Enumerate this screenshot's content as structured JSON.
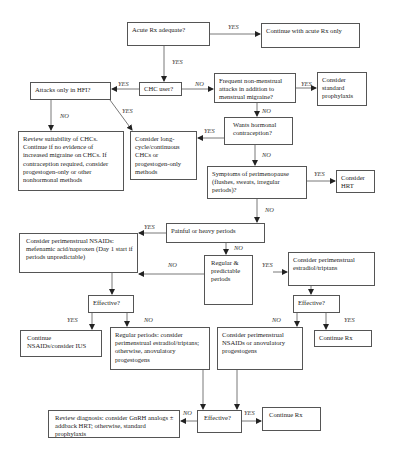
{
  "flowchart": {
    "nodes": {
      "acute_rx": "Acute Rx adequate?",
      "continue_acute": "Continue with acute Rx only",
      "chc_user": "CHC user?",
      "attacks_hfi": "Attacks only in HFI?",
      "frequent_nonmenstrual": "Frequent non-menstrual attacks in addition to menstrual migraine?",
      "standard_prophylaxis": "Consider standard prophylaxis",
      "review_chc": "Review suitability of CHCs. Continue if no evidence of increased migraine on CHCs. If contraception required, consider progestogen-only or other nonhormonal methods",
      "long_cycle": "Consider long-cycle/continuous CHCs or progestogen-only methods",
      "wants_hormonal": "Wants hormonal contraception?",
      "perimenopause": "Symptoms of perimenopause (flushes, sweats, irregular periods)?",
      "consider_hrt": "Consider HRT",
      "painful_heavy": "Painful or heavy periods",
      "nsaids": "Consider perimenstrual NSAIDs: mefenamic acid/naproxen (Day 1 start if periods unpredictable)",
      "regular_predictable": "Regular & predictable periods",
      "estradiol_triptans": "Consider perimenstrual estradiol/triptans",
      "effective_left": "Effective?",
      "effective_right": "Effective?",
      "continue_nsaids": "Continue NSAIDs/consider IUS",
      "regular_consider": "Regular periods: consider perimenstrual estradiol/triptans; otherwise, anovulatory progestogens",
      "nsaids_anovulatory": "Consider perimenstrual NSAIDs or anovulatory progestogens",
      "continue_rx_right": "Continue Rx",
      "effective_bottom": "Effective?",
      "review_diagnosis": "Review diagnosis: consider GnRH analogs ± addback HRT; otherwise, standard prophylaxis",
      "continue_rx_bottom": "Continue Rx"
    },
    "edge_labels": {
      "yes": "YES",
      "no": "NO"
    }
  }
}
